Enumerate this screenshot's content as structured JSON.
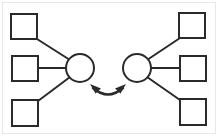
{
  "diagram": {
    "type": "node-link-diagram",
    "canvas": {
      "width": 218,
      "height": 136,
      "background": "#ffffff"
    },
    "style": {
      "stroke_color": "#2a2a2a",
      "stroke_width": 2,
      "fill_color": "#ffffff",
      "scan_border_color": "#e2e2e2"
    },
    "hubs": [
      {
        "id": "hub-left",
        "shape": "circle",
        "cx": 80,
        "cy": 68,
        "r": 14,
        "label": ""
      },
      {
        "id": "hub-right",
        "shape": "circle",
        "cx": 137,
        "cy": 68,
        "r": 14,
        "label": ""
      }
    ],
    "leaves": [
      {
        "id": "leaf-top-left",
        "shape": "square",
        "x": 11,
        "y": 14,
        "width": 26,
        "height": 25,
        "label": ""
      },
      {
        "id": "leaf-middle-left",
        "shape": "square",
        "x": 12,
        "y": 56,
        "width": 26,
        "height": 25,
        "label": ""
      },
      {
        "id": "leaf-bottom-left",
        "shape": "square",
        "x": 12,
        "y": 100,
        "width": 26,
        "height": 26,
        "label": ""
      },
      {
        "id": "leaf-top-right",
        "shape": "square",
        "x": 179,
        "y": 13,
        "width": 26,
        "height": 25,
        "label": ""
      },
      {
        "id": "leaf-middle-right",
        "shape": "square",
        "x": 180,
        "y": 56,
        "width": 26,
        "height": 25,
        "label": ""
      },
      {
        "id": "leaf-bottom-right",
        "shape": "square",
        "x": 180,
        "y": 99,
        "width": 26,
        "height": 26,
        "label": ""
      }
    ],
    "connectors": [
      {
        "id": "edge-top-left-to-hub-left",
        "from": "leaf-top-left",
        "to": "hub-left",
        "x1": 37,
        "y1": 39,
        "x2": 70,
        "y2": 60
      },
      {
        "id": "edge-middle-left-to-hub-left",
        "from": "leaf-middle-left",
        "to": "hub-left",
        "x1": 38,
        "y1": 68,
        "x2": 66,
        "y2": 68
      },
      {
        "id": "edge-bottom-left-to-hub-left",
        "from": "leaf-bottom-left",
        "to": "hub-left",
        "x1": 38,
        "y1": 101,
        "x2": 70,
        "y2": 77
      },
      {
        "id": "edge-top-right-to-hub-right",
        "from": "leaf-top-right",
        "to": "hub-right",
        "x1": 180,
        "y1": 38,
        "x2": 147,
        "y2": 60
      },
      {
        "id": "edge-middle-right-to-hub-right",
        "from": "leaf-middle-right",
        "to": "hub-right",
        "x1": 180,
        "y1": 68,
        "x2": 151,
        "y2": 68
      },
      {
        "id": "edge-bottom-right-to-hub-right",
        "from": "leaf-bottom-right",
        "to": "hub-right",
        "x1": 180,
        "y1": 100,
        "x2": 147,
        "y2": 77
      }
    ],
    "bidirectional_arrow": {
      "id": "hub-link-arrow",
      "from": "hub-left",
      "to": "hub-right",
      "direction": "both",
      "curve": "downward-arc",
      "path": "M 93 88 Q 108 101 123 88",
      "head_left": {
        "tip_x": 90,
        "tip_y": 85,
        "points": "90,85 100,88 95,93"
      },
      "head_right": {
        "tip_x": 126,
        "tip_y": 85,
        "points": "126,85 116,88 121,93"
      }
    }
  }
}
